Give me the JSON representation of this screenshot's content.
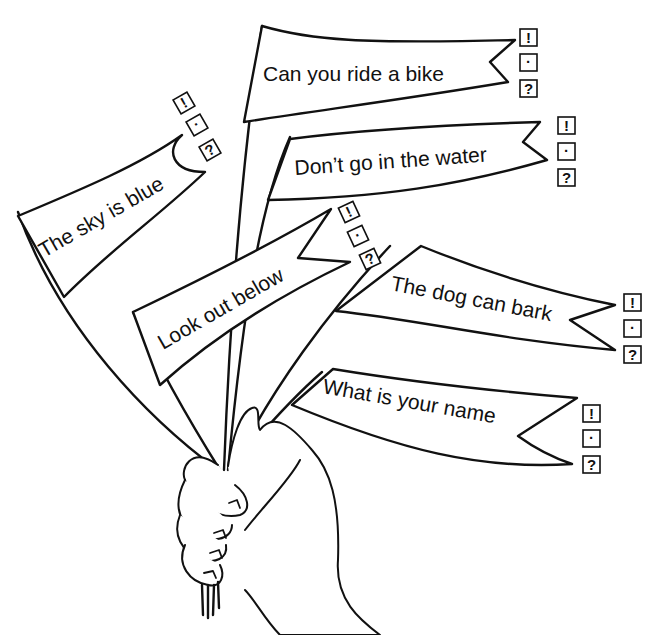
{
  "worksheet": {
    "title": "Punctuation flags",
    "instruction_hint": "Choose the correct punctuation mark for each flag",
    "choices": [
      "!",
      "·",
      "?"
    ],
    "colors": {
      "ink": "#111111",
      "paper": "#ffffff"
    },
    "flags": [
      {
        "id": "sky",
        "text": "The sky is blue"
      },
      {
        "id": "bike",
        "text": "Can you ride a bike"
      },
      {
        "id": "water",
        "text": "Don’t go in the water"
      },
      {
        "id": "below",
        "text": "Look out below"
      },
      {
        "id": "dog",
        "text": "The dog can bark"
      },
      {
        "id": "name",
        "text": "What is your name"
      }
    ]
  },
  "icons": {
    "exclamation": "!",
    "period": "·",
    "question": "?"
  }
}
